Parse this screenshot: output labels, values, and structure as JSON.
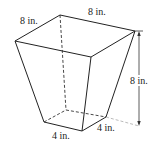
{
  "figure": {
    "type": "frustum-square-pyramid-inverted",
    "labels": {
      "top_left_edge": "8 in.",
      "top_back_edge": "8 in.",
      "height": "8 in.",
      "bottom_front_edge": "4 in.",
      "bottom_right_edge": "4 in."
    }
  }
}
